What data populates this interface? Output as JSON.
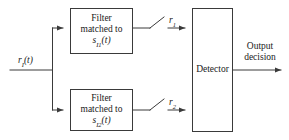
{
  "figure": {
    "type": "block-diagram",
    "background_color": "#ffffff",
    "line_color": "#3a3a3a",
    "text_color": "#1a1a1a"
  },
  "input": {
    "label_base": "r",
    "label_sub": "I",
    "label_arg": "(t)",
    "full": "r_I(t)"
  },
  "blocks": {
    "filter_top": {
      "line1": "Filter",
      "line2": "matched to",
      "line3_base": "s",
      "line3_sub": "I1",
      "line3_arg": "(t)"
    },
    "filter_bottom": {
      "line1": "Filter",
      "line2": "matched to",
      "line3_base": "s",
      "line3_sub": "I2",
      "line3_arg": "(t)"
    },
    "detector": {
      "label": "Detector"
    }
  },
  "samplers": {
    "top": {
      "label_base": "r",
      "label_sub": "1",
      "full": "r_1"
    },
    "bottom": {
      "label_base": "r",
      "label_sub": "2",
      "full": "r_2"
    }
  },
  "output": {
    "line1": "Output",
    "line2": "decision"
  }
}
